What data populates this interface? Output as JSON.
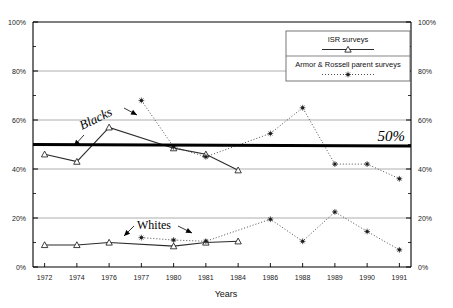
{
  "chart_data": {
    "type": "line",
    "title": "",
    "xlabel": "Years",
    "ylabel": "",
    "categories": [
      "1972",
      "1974",
      "1976",
      "1977",
      "1980",
      "1981",
      "1984",
      "1986",
      "1988",
      "1989",
      "1990",
      "1991"
    ],
    "ylim": [
      0,
      100
    ],
    "ytick_labels_left": [
      "100%",
      "80%",
      "60%",
      "40%",
      "20%",
      "0%"
    ],
    "ytick_labels_right": [
      "100%",
      "80%",
      "60%",
      "40%",
      "20%",
      "0%"
    ],
    "ytick_values": [
      100,
      80,
      60,
      40,
      20,
      0
    ],
    "yminor_values": [
      90,
      70,
      50,
      30,
      10
    ],
    "grid": "horizontal-major",
    "legend_position": "top-right-inside",
    "reference_line": {
      "value": 50,
      "label": "50%"
    },
    "series": [
      {
        "name": "ISR surveys",
        "group": "Blacks",
        "marker": "open-triangle",
        "line": "solid",
        "x": [
          "1972",
          "1974",
          "1976",
          "1980",
          "1981",
          "1984"
        ],
        "values": [
          46,
          43,
          57,
          48.5,
          46,
          39.5
        ]
      },
      {
        "name": "ISR surveys",
        "group": "Whites",
        "marker": "open-triangle",
        "line": "solid",
        "x": [
          "1972",
          "1974",
          "1976",
          "1980",
          "1981",
          "1984"
        ],
        "values": [
          9,
          9,
          10,
          8.5,
          10,
          10.5
        ]
      },
      {
        "name": "Armor & Rossell parent surveys",
        "group": "Blacks",
        "marker": "dot-asterisk",
        "line": "dotted",
        "x": [
          "1977",
          "1980",
          "1981",
          "1986",
          "1988",
          "1989",
          "1990",
          "1991"
        ],
        "values": [
          68,
          49,
          45,
          54.5,
          65,
          42,
          42,
          36
        ]
      },
      {
        "name": "Armor & Rossell parent surveys",
        "group": "Whites",
        "marker": "dot-asterisk",
        "line": "dotted",
        "x": [
          "1977",
          "1980",
          "1981",
          "1986",
          "1988",
          "1989",
          "1990",
          "1991"
        ],
        "values": [
          12,
          11,
          10.5,
          19.5,
          10.5,
          22.5,
          14.5,
          7
        ]
      }
    ],
    "annotations": [
      {
        "text": "Blacks",
        "kind": "group-label"
      },
      {
        "text": "Whites",
        "kind": "group-label"
      },
      {
        "text": "50%",
        "kind": "reference-line-label"
      }
    ]
  },
  "legend": {
    "entries": [
      {
        "label": "ISR surveys",
        "marker": "open-triangle",
        "line": "solid"
      },
      {
        "label": "Armor & Rossell parent surveys",
        "marker": "dot-asterisk",
        "line": "dotted"
      }
    ]
  },
  "axes": {
    "x_title": "Years",
    "left_labels": [
      "100%",
      "80%",
      "60%",
      "40%",
      "20%",
      "0%"
    ],
    "right_labels": [
      "100%",
      "80%",
      "60%",
      "40%",
      "20%",
      "0%"
    ],
    "x_labels": [
      "1972",
      "1974",
      "1976",
      "1977",
      "1980",
      "1981",
      "1984",
      "1986",
      "1988",
      "1989",
      "1990",
      "1991"
    ]
  },
  "colors": {
    "axis": "#000000",
    "grid": "#9a9a9a",
    "series_isr": "#2b2b2b",
    "series_armor": "#3a3a3a",
    "reference": "#000000",
    "background": "#ffffff"
  }
}
